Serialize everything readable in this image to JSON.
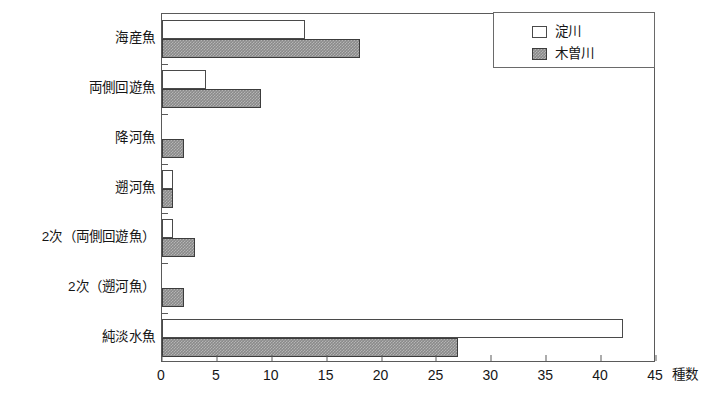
{
  "chart_data": {
    "type": "bar",
    "orientation": "horizontal",
    "title": "",
    "xlabel": "種数",
    "ylabel": "",
    "xlim": [
      0,
      45
    ],
    "xticks": [
      0,
      5,
      10,
      15,
      20,
      25,
      30,
      35,
      40,
      45
    ],
    "grid": false,
    "legend_position": "top-right",
    "categories": [
      "海産魚",
      "両側回遊魚",
      "降河魚",
      "遡河魚",
      "2次（両側回遊魚）",
      "2次（遡河魚）",
      "純淡水魚"
    ],
    "series": [
      {
        "name": "淀川",
        "color": "#ffffff",
        "values": [
          13,
          4,
          0,
          1,
          1,
          0,
          42
        ]
      },
      {
        "name": "木曽川",
        "color": "#8a8a8a",
        "values": [
          18,
          9,
          2,
          1,
          3,
          2,
          27
        ]
      }
    ]
  },
  "legend": {
    "items": [
      {
        "label": "淀川"
      },
      {
        "label": "木曽川"
      }
    ]
  }
}
